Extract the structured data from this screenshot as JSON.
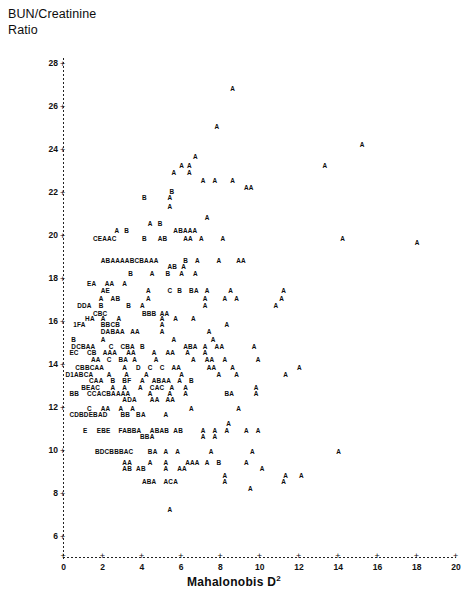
{
  "title": "BUN/Creatinine\nRatio",
  "axes": {
    "x": {
      "label": "Mahalonobis D",
      "exponent": "2",
      "ticks": [
        0,
        2,
        4,
        6,
        8,
        10,
        12,
        14,
        16,
        18,
        20
      ],
      "tick_mark": "+",
      "min": 0,
      "max": 20
    },
    "y": {
      "label": "BUN/Creatinine Ratio",
      "ticks": [
        28,
        26,
        24,
        22,
        20,
        18,
        16,
        14,
        12,
        10,
        8,
        6
      ],
      "tick_mark": "+",
      "min": 6,
      "max": 28
    }
  },
  "chart_data": {
    "type": "scatter",
    "title": "BUN/Creatinine Ratio",
    "xlabel": "Mahalonobis D2",
    "ylabel": "BUN/Creatinine Ratio",
    "xlim": [
      0,
      20
    ],
    "ylim": [
      6,
      28
    ],
    "grid": false,
    "legend": "none",
    "note": "Character scatter plot: each plotted glyph is a letter code where A=1 observation, B=2, C=3, D=4, E=5, F=6, I=9 overlapping observations at that coordinate.",
    "symbol_counts": {
      "A": 1,
      "B": 2,
      "C": 3,
      "D": 4,
      "E": 5,
      "F": 6,
      "I": 9
    },
    "rows": [
      {
        "y": 26.9,
        "glyphs": [
          {
            "x": 8.5,
            "s": "A"
          }
        ]
      },
      {
        "y": 25.1,
        "glyphs": [
          {
            "x": 7.7,
            "s": "A"
          }
        ]
      },
      {
        "y": 24.3,
        "glyphs": [
          {
            "x": 15.1,
            "s": "A"
          }
        ]
      },
      {
        "y": 23.7,
        "glyphs": [
          {
            "x": 6.6,
            "s": "A"
          }
        ]
      },
      {
        "y": 23.3,
        "glyphs": [
          {
            "x": 5.9,
            "s": "A"
          },
          {
            "x": 6.3,
            "s": "A"
          },
          {
            "x": 13.2,
            "s": "A"
          }
        ]
      },
      {
        "y": 23.0,
        "glyphs": [
          {
            "x": 5.5,
            "s": "A"
          },
          {
            "x": 6.3,
            "s": "A"
          }
        ]
      },
      {
        "y": 22.6,
        "glyphs": [
          {
            "x": 7.0,
            "s": "A"
          },
          {
            "x": 7.6,
            "s": "A"
          },
          {
            "x": 8.5,
            "s": "A"
          }
        ]
      },
      {
        "y": 22.3,
        "glyphs": [
          {
            "x": 9.2,
            "s": "AA"
          }
        ]
      },
      {
        "y": 22.1,
        "glyphs": [
          {
            "x": 5.4,
            "s": "B"
          }
        ]
      },
      {
        "y": 21.8,
        "glyphs": [
          {
            "x": 4.0,
            "s": "B"
          },
          {
            "x": 5.3,
            "s": "A"
          }
        ]
      },
      {
        "y": 21.4,
        "glyphs": [
          {
            "x": 5.3,
            "s": "A"
          }
        ]
      },
      {
        "y": 20.9,
        "glyphs": [
          {
            "x": 7.2,
            "s": "A"
          }
        ]
      },
      {
        "y": 20.6,
        "glyphs": [
          {
            "x": 4.3,
            "s": "A"
          },
          {
            "x": 4.8,
            "s": "B"
          }
        ]
      },
      {
        "y": 20.3,
        "glyphs": [
          {
            "x": 2.6,
            "s": "A"
          },
          {
            "x": 3.1,
            "s": "B"
          },
          {
            "x": 5.6,
            "s": "ABAAA"
          }
        ]
      },
      {
        "y": 19.9,
        "glyphs": [
          {
            "x": 1.5,
            "s": "CEAAC"
          },
          {
            "x": 4.0,
            "s": "B"
          },
          {
            "x": 4.8,
            "s": "AB"
          },
          {
            "x": 6.1,
            "s": "AA"
          },
          {
            "x": 6.9,
            "s": "A"
          },
          {
            "x": 8.0,
            "s": "A"
          },
          {
            "x": 14.1,
            "s": "A"
          }
        ]
      },
      {
        "y": 19.7,
        "glyphs": [
          {
            "x": 17.9,
            "s": "A"
          }
        ]
      },
      {
        "y": 18.9,
        "glyphs": [
          {
            "x": 1.9,
            "s": "ABAAAABCBAAA"
          },
          {
            "x": 6.1,
            "s": "B"
          },
          {
            "x": 6.7,
            "s": "A"
          },
          {
            "x": 7.8,
            "s": "A"
          },
          {
            "x": 8.8,
            "s": "AA"
          }
        ]
      },
      {
        "y": 18.6,
        "glyphs": [
          {
            "x": 5.3,
            "s": "AB"
          },
          {
            "x": 6.0,
            "s": "A"
          }
        ]
      },
      {
        "y": 18.3,
        "glyphs": [
          {
            "x": 3.3,
            "s": "B"
          },
          {
            "x": 4.4,
            "s": "A"
          },
          {
            "x": 5.2,
            "s": "B"
          },
          {
            "x": 5.9,
            "s": "A"
          },
          {
            "x": 6.6,
            "s": "A"
          }
        ]
      },
      {
        "y": 17.8,
        "glyphs": [
          {
            "x": 1.2,
            "s": "EA"
          },
          {
            "x": 2.1,
            "s": "AA"
          },
          {
            "x": 3.0,
            "s": "A"
          }
        ]
      },
      {
        "y": 17.5,
        "glyphs": [
          {
            "x": 1.9,
            "s": "AE"
          },
          {
            "x": 4.2,
            "s": "A"
          },
          {
            "x": 5.3,
            "s": "C"
          },
          {
            "x": 5.8,
            "s": "B"
          },
          {
            "x": 6.4,
            "s": "BA"
          },
          {
            "x": 7.2,
            "s": "A"
          },
          {
            "x": 8.4,
            "s": "A"
          },
          {
            "x": 11.1,
            "s": "A"
          }
        ]
      },
      {
        "y": 17.1,
        "glyphs": [
          {
            "x": 1.8,
            "s": "A"
          },
          {
            "x": 2.4,
            "s": "AB"
          },
          {
            "x": 4.2,
            "s": "A"
          },
          {
            "x": 7.1,
            "s": "A"
          },
          {
            "x": 8.1,
            "s": "A"
          },
          {
            "x": 8.7,
            "s": "A"
          },
          {
            "x": 11.0,
            "s": "A"
          }
        ]
      },
      {
        "y": 16.8,
        "glyphs": [
          {
            "x": 0.7,
            "s": "DDA"
          },
          {
            "x": 1.8,
            "s": "B"
          },
          {
            "x": 3.2,
            "s": "B"
          },
          {
            "x": 3.9,
            "s": "A"
          },
          {
            "x": 7.1,
            "s": "A"
          },
          {
            "x": 10.7,
            "s": "A"
          }
        ]
      },
      {
        "y": 16.4,
        "glyphs": [
          {
            "x": 1.5,
            "s": "CBC"
          },
          {
            "x": 4.0,
            "s": "BBB"
          },
          {
            "x": 4.9,
            "s": "AA"
          }
        ]
      },
      {
        "y": 16.2,
        "glyphs": [
          {
            "x": 1.1,
            "s": "HA"
          },
          {
            "x": 1.9,
            "s": "A"
          },
          {
            "x": 2.7,
            "s": "A"
          },
          {
            "x": 4.9,
            "s": "A"
          },
          {
            "x": 5.6,
            "s": "A"
          },
          {
            "x": 6.5,
            "s": "A"
          }
        ]
      },
      {
        "y": 15.9,
        "glyphs": [
          {
            "x": 0.5,
            "s": "1FA"
          },
          {
            "x": 1.9,
            "s": "BBCB"
          },
          {
            "x": 4.9,
            "s": "A"
          },
          {
            "x": 8.2,
            "s": "A"
          }
        ]
      },
      {
        "y": 15.6,
        "glyphs": [
          {
            "x": 1.9,
            "s": "DABAA"
          },
          {
            "x": 3.4,
            "s": "AA"
          },
          {
            "x": 4.9,
            "s": "A"
          },
          {
            "x": 7.3,
            "s": "A"
          }
        ]
      },
      {
        "y": 15.2,
        "glyphs": [
          {
            "x": 0.4,
            "s": "B"
          },
          {
            "x": 1.9,
            "s": "A"
          },
          {
            "x": 5.5,
            "s": "A"
          },
          {
            "x": 7.5,
            "s": "A"
          }
        ]
      },
      {
        "y": 14.9,
        "glyphs": [
          {
            "x": 0.4,
            "s": "DCBAA"
          },
          {
            "x": 2.3,
            "s": "C"
          },
          {
            "x": 2.9,
            "s": "CBA"
          },
          {
            "x": 3.9,
            "s": "B"
          },
          {
            "x": 6.1,
            "s": "ABA"
          },
          {
            "x": 7.1,
            "s": "A"
          },
          {
            "x": 7.7,
            "s": "AA"
          },
          {
            "x": 9.6,
            "s": "A"
          }
        ]
      },
      {
        "y": 14.6,
        "glyphs": [
          {
            "x": 0.3,
            "s": "EC"
          },
          {
            "x": 1.2,
            "s": "CB"
          },
          {
            "x": 2.0,
            "s": "AAA"
          },
          {
            "x": 3.2,
            "s": "AA"
          },
          {
            "x": 4.5,
            "s": "A"
          },
          {
            "x": 5.2,
            "s": "AA"
          },
          {
            "x": 6.2,
            "s": "A"
          },
          {
            "x": 7.1,
            "s": "A"
          }
        ]
      },
      {
        "y": 14.3,
        "glyphs": [
          {
            "x": 1.4,
            "s": "AA"
          },
          {
            "x": 2.2,
            "s": "C"
          },
          {
            "x": 2.8,
            "s": "BA"
          },
          {
            "x": 3.5,
            "s": "A"
          },
          {
            "x": 4.6,
            "s": "A"
          },
          {
            "x": 6.5,
            "s": "A"
          },
          {
            "x": 7.2,
            "s": "AA"
          },
          {
            "x": 8.1,
            "s": "A"
          },
          {
            "x": 9.8,
            "s": "A"
          }
        ]
      },
      {
        "y": 13.9,
        "glyphs": [
          {
            "x": 0.6,
            "s": "CBBCAA"
          },
          {
            "x": 3.0,
            "s": "A"
          },
          {
            "x": 3.7,
            "s": "D"
          },
          {
            "x": 4.3,
            "s": "C"
          },
          {
            "x": 4.9,
            "s": "C"
          },
          {
            "x": 5.5,
            "s": "AA"
          },
          {
            "x": 7.3,
            "s": "AA"
          },
          {
            "x": 8.5,
            "s": "A"
          },
          {
            "x": 11.9,
            "s": "A"
          }
        ]
      },
      {
        "y": 13.6,
        "glyphs": [
          {
            "x": 0.1,
            "s": "D1ABCA"
          },
          {
            "x": 2.2,
            "s": "A"
          },
          {
            "x": 3.1,
            "s": "A"
          },
          {
            "x": 4.1,
            "s": "A"
          },
          {
            "x": 5.9,
            "s": "A"
          },
          {
            "x": 7.8,
            "s": "A"
          },
          {
            "x": 8.7,
            "s": "A"
          },
          {
            "x": 11.2,
            "s": "A"
          }
        ]
      },
      {
        "y": 13.3,
        "glyphs": [
          {
            "x": 1.3,
            "s": "CAA"
          },
          {
            "x": 2.4,
            "s": "B"
          },
          {
            "x": 3.0,
            "s": "BF"
          },
          {
            "x": 3.9,
            "s": "A"
          },
          {
            "x": 4.5,
            "s": "ABAA"
          },
          {
            "x": 5.8,
            "s": "A"
          },
          {
            "x": 6.4,
            "s": "B"
          }
        ]
      },
      {
        "y": 13.0,
        "glyphs": [
          {
            "x": 0.9,
            "s": "BEAC"
          },
          {
            "x": 2.4,
            "s": "A"
          },
          {
            "x": 3.0,
            "s": "A"
          },
          {
            "x": 3.8,
            "s": "A"
          },
          {
            "x": 4.4,
            "s": "CAC"
          },
          {
            "x": 5.4,
            "s": "A"
          },
          {
            "x": 6.1,
            "s": "A"
          },
          {
            "x": 9.7,
            "s": "A"
          }
        ]
      },
      {
        "y": 12.7,
        "glyphs": [
          {
            "x": 0.3,
            "s": "BB"
          },
          {
            "x": 1.2,
            "s": "CCACBAAAA"
          },
          {
            "x": 4.3,
            "s": "A"
          },
          {
            "x": 5.3,
            "s": "A"
          },
          {
            "x": 6.1,
            "s": "A"
          },
          {
            "x": 8.2,
            "s": "BA"
          },
          {
            "x": 9.7,
            "s": "A"
          }
        ]
      },
      {
        "y": 12.4,
        "glyphs": [
          {
            "x": 3.0,
            "s": "ADA"
          },
          {
            "x": 4.4,
            "s": "AA"
          },
          {
            "x": 5.2,
            "s": "AA"
          }
        ]
      },
      {
        "y": 12.0,
        "glyphs": [
          {
            "x": 1.2,
            "s": "C"
          },
          {
            "x": 1.9,
            "s": "AA"
          },
          {
            "x": 2.8,
            "s": "A"
          },
          {
            "x": 3.4,
            "s": "A"
          },
          {
            "x": 6.4,
            "s": "A"
          },
          {
            "x": 8.8,
            "s": "A"
          }
        ]
      },
      {
        "y": 11.7,
        "glyphs": [
          {
            "x": 0.3,
            "s": "CDBDEBAD"
          },
          {
            "x": 2.9,
            "s": "BB"
          },
          {
            "x": 3.7,
            "s": "BA"
          },
          {
            "x": 5.1,
            "s": "A"
          }
        ]
      },
      {
        "y": 11.3,
        "glyphs": [
          {
            "x": 8.3,
            "s": "A"
          }
        ]
      },
      {
        "y": 11.0,
        "glyphs": [
          {
            "x": 1.0,
            "s": "E"
          },
          {
            "x": 1.7,
            "s": "EBE"
          },
          {
            "x": 2.8,
            "s": "FABBA"
          },
          {
            "x": 4.4,
            "s": "ABAB"
          },
          {
            "x": 5.6,
            "s": "AB"
          },
          {
            "x": 7.0,
            "s": "A"
          },
          {
            "x": 7.6,
            "s": "A"
          },
          {
            "x": 8.2,
            "s": "A"
          },
          {
            "x": 9.2,
            "s": "A"
          },
          {
            "x": 9.8,
            "s": "A"
          }
        ]
      },
      {
        "y": 10.7,
        "glyphs": [
          {
            "x": 3.9,
            "s": "BBA"
          },
          {
            "x": 7.0,
            "s": "A"
          },
          {
            "x": 7.6,
            "s": "A"
          }
        ]
      },
      {
        "y": 10.0,
        "glyphs": [
          {
            "x": 1.6,
            "s": "BDCBBBAC"
          },
          {
            "x": 4.3,
            "s": "BA"
          },
          {
            "x": 5.1,
            "s": "A"
          },
          {
            "x": 5.7,
            "s": "A"
          },
          {
            "x": 7.4,
            "s": "A"
          },
          {
            "x": 9.5,
            "s": "A"
          },
          {
            "x": 13.9,
            "s": "A"
          }
        ]
      },
      {
        "y": 9.5,
        "glyphs": [
          {
            "x": 3.0,
            "s": "AA"
          },
          {
            "x": 4.3,
            "s": "A"
          },
          {
            "x": 5.1,
            "s": "A"
          },
          {
            "x": 6.2,
            "s": "AAA"
          },
          {
            "x": 7.2,
            "s": "A"
          },
          {
            "x": 7.8,
            "s": "B"
          },
          {
            "x": 9.2,
            "s": "A"
          }
        ]
      },
      {
        "y": 9.2,
        "glyphs": [
          {
            "x": 3.0,
            "s": "AB"
          },
          {
            "x": 3.7,
            "s": "AB"
          },
          {
            "x": 5.1,
            "s": "A"
          },
          {
            "x": 5.8,
            "s": "AA"
          },
          {
            "x": 10.0,
            "s": "A"
          }
        ]
      },
      {
        "y": 8.9,
        "glyphs": [
          {
            "x": 8.1,
            "s": "A"
          },
          {
            "x": 11.2,
            "s": "A"
          },
          {
            "x": 12.0,
            "s": "A"
          }
        ]
      },
      {
        "y": 8.6,
        "glyphs": [
          {
            "x": 4.0,
            "s": "ABA"
          },
          {
            "x": 5.1,
            "s": "ACA"
          },
          {
            "x": 8.1,
            "s": "A"
          },
          {
            "x": 11.1,
            "s": "A"
          }
        ]
      },
      {
        "y": 8.3,
        "glyphs": [
          {
            "x": 9.4,
            "s": "A"
          }
        ]
      },
      {
        "y": 7.3,
        "glyphs": [
          {
            "x": 5.3,
            "s": "A"
          }
        ]
      }
    ]
  }
}
